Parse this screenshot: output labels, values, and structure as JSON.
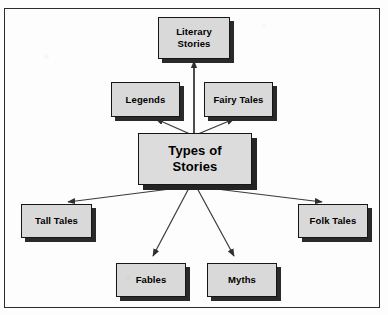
{
  "diagram": {
    "type": "concept-map",
    "title_node": "Types of Stories",
    "colors": {
      "node_fill": "#d9d9d9",
      "node_border": "#161616",
      "node_shadow": "#2a2a2a",
      "connector": "#3a3a3a",
      "page_border": "#2b2b2b",
      "background": "#fdfdfd"
    },
    "center": {
      "line1": "Types of",
      "line2": "Stories"
    },
    "nodes": [
      {
        "id": "literary-stories",
        "line1": "Literary",
        "line2": "Stories"
      },
      {
        "id": "legends",
        "line1": "Legends",
        "line2": ""
      },
      {
        "id": "fairy-tales",
        "line1": "Fairy Tales",
        "line2": ""
      },
      {
        "id": "tall-tales",
        "line1": "Tall Tales",
        "line2": ""
      },
      {
        "id": "folk-tales",
        "line1": "Folk Tales",
        "line2": ""
      },
      {
        "id": "fables",
        "line1": "Fables",
        "line2": ""
      },
      {
        "id": "myths",
        "line1": "Myths",
        "line2": ""
      }
    ],
    "edges": [
      {
        "from": "Types of Stories",
        "to": "Literary Stories"
      },
      {
        "from": "Types of Stories",
        "to": "Legends"
      },
      {
        "from": "Types of Stories",
        "to": "Fairy Tales"
      },
      {
        "from": "Types of Stories",
        "to": "Tall Tales"
      },
      {
        "from": "Types of Stories",
        "to": "Folk Tales"
      },
      {
        "from": "Types of Stories",
        "to": "Fables"
      },
      {
        "from": "Types of Stories",
        "to": "Myths"
      }
    ]
  }
}
